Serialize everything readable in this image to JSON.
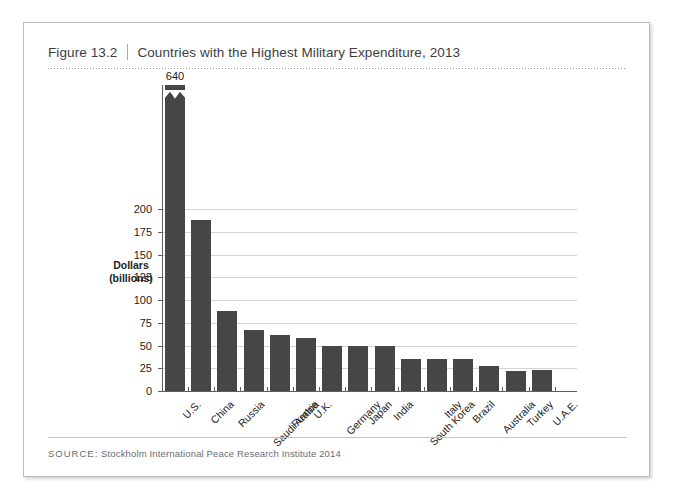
{
  "figure": {
    "number": "Figure 13.2",
    "title": "Countries with the Highest Military Expenditure, 2013",
    "source_label": "SOURCE:",
    "source_text": "Stockholm International Peace Research Institute 2014"
  },
  "chart_data": {
    "type": "bar",
    "title": "Countries with the Highest Military Expenditure, 2013",
    "xlabel": "",
    "ylabel": "Dollars (billions)",
    "ylabel_line1": "Dollars",
    "ylabel_line2": "(billions)",
    "ylim": [
      0,
      200
    ],
    "yticks": [
      0,
      25,
      50,
      75,
      100,
      125,
      150,
      175,
      200
    ],
    "ytick_labels": [
      "0",
      "25",
      "50",
      "75",
      "100",
      "125",
      "150",
      "175",
      "200"
    ],
    "grid": true,
    "legend": "none",
    "axis_break": {
      "present": true,
      "series_index": 0,
      "note": "U.S. bar truncated with zigzag break symbol"
    },
    "categories": [
      "U.S.",
      "China",
      "Russia",
      "Saudi Arabia",
      "France",
      "U.K.",
      "Germany",
      "Japan",
      "India",
      "South Korea",
      "Italy",
      "Brazil",
      "Australia",
      "Turkey",
      "U.A.E."
    ],
    "values": [
      640,
      188,
      88,
      67,
      61,
      58,
      50,
      50,
      49,
      35,
      35,
      35,
      27,
      22,
      23
    ],
    "data_labels": [
      "640",
      "",
      "",
      "",
      "",
      "",
      "",
      "",
      "",
      "",
      "",
      "",
      "",
      "",
      ""
    ],
    "bar_color": "#464646",
    "gridline_color": "#d2d4d6",
    "axis_color": "#5b5f62"
  }
}
